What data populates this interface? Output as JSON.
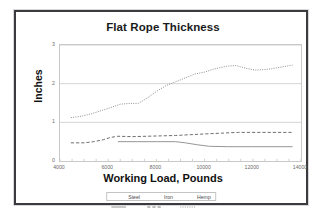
{
  "chart_data": {
    "type": "line",
    "title": "Flat Rope Thickness",
    "xlabel": "Working Load, Pounds",
    "ylabel": "Inches",
    "xlim": [
      4000,
      14000
    ],
    "ylim": [
      0,
      3
    ],
    "xticks": [
      "4000",
      "6000",
      "8000",
      "10000",
      "12000",
      "14000"
    ],
    "yticks": [
      "0",
      "1",
      "2",
      "3"
    ],
    "grid": "horizontal",
    "legend_position": "bottom-center",
    "series": [
      {
        "name": "Steel",
        "style": "solid",
        "color": "#8a8a8a",
        "x": [
          6400,
          7200,
          8000,
          8800,
          9200,
          9700,
          10200,
          11000,
          12000,
          13000,
          13650
        ],
        "values": [
          0.5,
          0.5,
          0.5,
          0.5,
          0.47,
          0.42,
          0.38,
          0.37,
          0.37,
          0.37,
          0.37
        ]
      },
      {
        "name": "Iron",
        "style": "dashed",
        "color": "#6e6e6e",
        "x": [
          4450,
          5000,
          5400,
          5800,
          6100,
          6400,
          7000,
          7600,
          8200,
          8800,
          9400,
          10000,
          10700,
          11400,
          12100,
          12800,
          13650
        ],
        "values": [
          0.47,
          0.47,
          0.5,
          0.55,
          0.61,
          0.64,
          0.63,
          0.64,
          0.65,
          0.66,
          0.68,
          0.7,
          0.72,
          0.74,
          0.74,
          0.74,
          0.74
        ]
      },
      {
        "name": "Hemp",
        "style": "dotted",
        "color": "#8f8f8f",
        "x": [
          4450,
          4900,
          5300,
          5700,
          6100,
          6500,
          6900,
          7250,
          7600,
          8000,
          8400,
          8800,
          9200,
          9600,
          10000,
          10400,
          10900,
          11300,
          11700,
          12100,
          12600,
          13100,
          13650
        ],
        "values": [
          1.12,
          1.16,
          1.22,
          1.3,
          1.38,
          1.47,
          1.49,
          1.49,
          1.62,
          1.8,
          1.95,
          2.05,
          2.15,
          2.25,
          2.3,
          2.38,
          2.45,
          2.47,
          2.4,
          2.35,
          2.37,
          2.42,
          2.48
        ]
      }
    ]
  },
  "legend": {
    "items": [
      {
        "label": "Steel"
      },
      {
        "label": "Iron"
      },
      {
        "label": "Hemp"
      }
    ]
  }
}
